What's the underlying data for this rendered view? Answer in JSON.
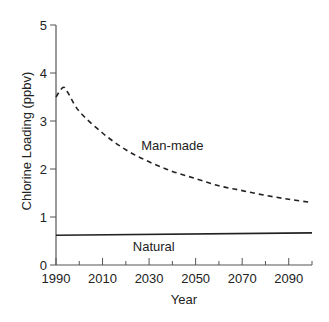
{
  "chart_data": {
    "type": "line",
    "title": "",
    "xlabel": "Year",
    "ylabel": "Chlorine Loading (ppbv)",
    "xlim": [
      1990,
      2100
    ],
    "ylim": [
      0,
      5
    ],
    "x_major_ticks": [
      1990,
      2010,
      2030,
      2050,
      2070,
      2090
    ],
    "x_minor_ticks": [
      2000,
      2020,
      2040,
      2060,
      2080,
      2100
    ],
    "y_ticks": [
      0,
      1,
      2,
      3,
      4,
      5
    ],
    "grid": false,
    "legend": "inline labels",
    "series": [
      {
        "name": "Man-made",
        "style": "dashed",
        "color": "#222222",
        "x": [
          1990,
          1993,
          1995,
          2000,
          2010,
          2020,
          2030,
          2040,
          2050,
          2060,
          2070,
          2080,
          2090,
          2100
        ],
        "values": [
          3.5,
          3.7,
          3.6,
          3.2,
          2.75,
          2.4,
          2.15,
          1.95,
          1.8,
          1.65,
          1.55,
          1.45,
          1.37,
          1.3
        ]
      },
      {
        "name": "Natural",
        "style": "solid",
        "color": "#222222",
        "x": [
          1990,
          2100
        ],
        "values": [
          0.62,
          0.67
        ]
      }
    ],
    "annotations": [
      {
        "text": "Man-made",
        "x": 2040,
        "y": 2.5
      },
      {
        "text": "Natural",
        "x": 2032,
        "y": 0.4
      }
    ]
  }
}
